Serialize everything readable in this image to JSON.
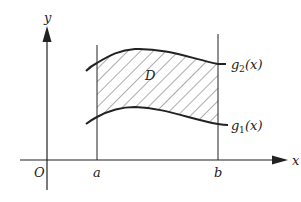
{
  "diagram": {
    "axes": {
      "x_label": "x",
      "y_label": "y",
      "origin_label": "O"
    },
    "bounds": {
      "left_label": "a",
      "right_label": "b"
    },
    "curves": [
      {
        "name": "upper",
        "label_main": "g",
        "label_sub": "2",
        "label_arg": "(x)"
      },
      {
        "name": "lower",
        "label_main": "g",
        "label_sub": "1",
        "label_arg": "(x)"
      }
    ],
    "region_label": "D",
    "colors": {
      "stroke": "#222222",
      "hatch": "#333333",
      "background": "#ffffff"
    }
  }
}
